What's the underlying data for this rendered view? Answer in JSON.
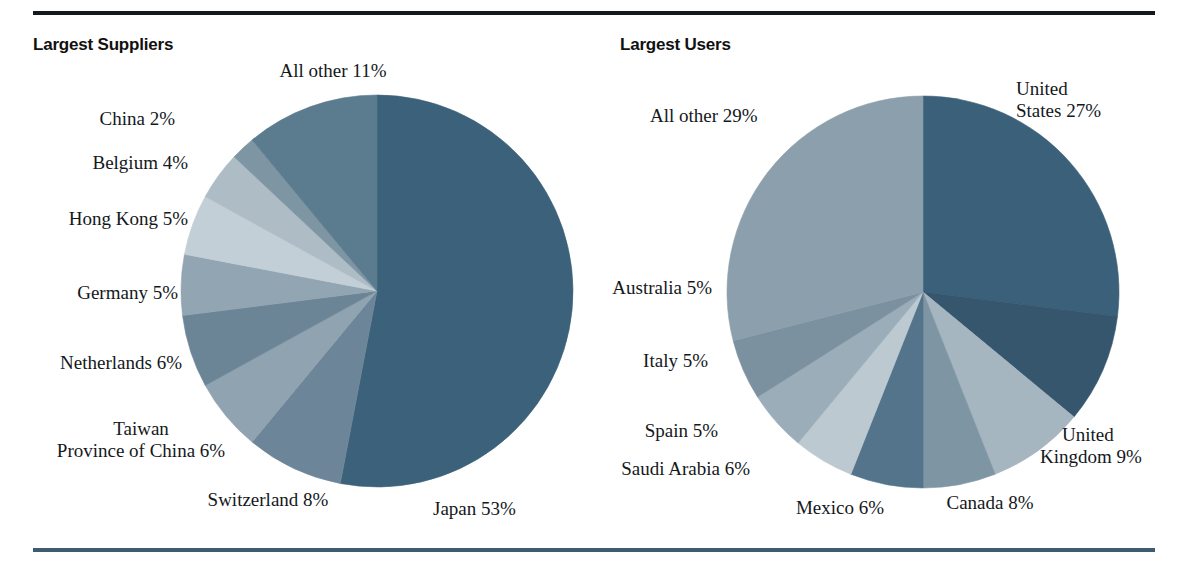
{
  "figure": {
    "top_rule_color": "#15191c",
    "bottom_rule_color": "#3d5c70",
    "background": "#ffffff"
  },
  "panels": [
    {
      "id": "suppliers",
      "title": "Largest Suppliers"
    },
    {
      "id": "users",
      "title": "Largest Users"
    }
  ],
  "chart_data": [
    {
      "type": "pie",
      "title": "Largest Suppliers",
      "xlabel": "",
      "ylabel": "",
      "legend": "none",
      "grid": false,
      "units": "percent",
      "start_angle_deg": 0,
      "direction": "clockwise",
      "categories": [
        "Japan",
        "Switzerland",
        "Taiwan Province of China",
        "Netherlands",
        "Germany",
        "Hong Kong",
        "Belgium",
        "China",
        "All other"
      ],
      "values": [
        53,
        8,
        6,
        6,
        5,
        5,
        4,
        2,
        11
      ],
      "labels": [
        "Japan 53%",
        "Switzerland 8%",
        "Taiwan\nProvince of China 6%",
        "Netherlands 6%",
        "Germany 5%",
        "Hong Kong 5%",
        "Belgium 4%",
        "China 2%",
        "All other 11%"
      ],
      "colors": [
        "#3c617a",
        "#6c8598",
        "#8fa3b0",
        "#6b8597",
        "#91a5b2",
        "#c3cfd6",
        "#aebcc5",
        "#7e95a4",
        "#5b7b8e"
      ]
    },
    {
      "type": "pie",
      "title": "Largest Users",
      "xlabel": "",
      "ylabel": "",
      "legend": "none",
      "grid": false,
      "units": "percent",
      "start_angle_deg": 0,
      "direction": "clockwise",
      "categories": [
        "United States",
        "United Kingdom",
        "Canada",
        "Mexico",
        "Saudi Arabia",
        "Spain",
        "Italy",
        "Australia",
        "All other"
      ],
      "values": [
        27,
        9,
        8,
        6,
        6,
        5,
        5,
        5,
        29
      ],
      "labels": [
        "United\nStates 27%",
        "United\nKingdom 9%",
        "Canada 8%",
        "Mexico 6%",
        "Saudi Arabia 6%",
        "Spain 5%",
        "Italy 5%",
        "Australia 5%",
        "All other 29%"
      ],
      "colors": [
        "#3b6079",
        "#35566d",
        "#a6b6c0",
        "#7e95a4",
        "#53748a",
        "#bdc9d1",
        "#9badb8",
        "#7b919f",
        "#8c9fac"
      ]
    }
  ],
  "labels": {
    "suppliers": {
      "all_other": "All other 11%",
      "china": "China 2%",
      "belgium": "Belgium 4%",
      "hong_kong": "Hong Kong 5%",
      "germany": "Germany 5%",
      "netherlands": "Netherlands 6%",
      "taiwan_line1": "Taiwan",
      "taiwan_line2": "Province of China 6%",
      "switzerland": "Switzerland 8%",
      "japan": "Japan 53%"
    },
    "users": {
      "all_other": "All other 29%",
      "united_states_line1": "United",
      "united_states_line2": "States 27%",
      "united_kingdom_line1": "United",
      "united_kingdom_line2": "Kingdom 9%",
      "canada": "Canada 8%",
      "mexico": "Mexico 6%",
      "saudi_arabia": "Saudi Arabia 6%",
      "spain": "Spain 5%",
      "italy": "Italy 5%",
      "australia": "Australia 5%"
    }
  }
}
